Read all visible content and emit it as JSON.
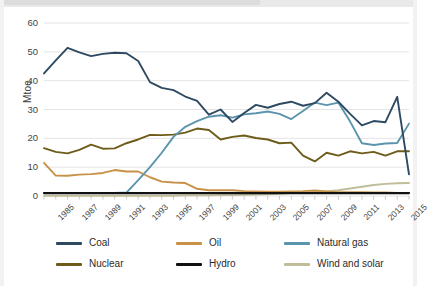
{
  "chart_data": {
    "type": "line",
    "title": "",
    "subtitle": "",
    "xlabel": "",
    "ylabel": "Mtoe",
    "xlim": [
      1985,
      2016
    ],
    "ylim": [
      0,
      60
    ],
    "yticks": [
      0,
      10,
      20,
      30,
      40,
      50,
      60
    ],
    "ytick_labels": [
      "0",
      "10",
      "20",
      "30",
      "40",
      "50",
      "60"
    ],
    "xtick_labels": [
      "1985",
      "1987",
      "1989",
      "1991",
      "1993",
      "1995",
      "1997",
      "1999",
      "2001",
      "2003",
      "2005",
      "2007",
      "2009",
      "2011",
      "2013",
      "2015"
    ],
    "x": [
      1985,
      1986,
      1987,
      1988,
      1989,
      1990,
      1991,
      1992,
      1993,
      1994,
      1995,
      1996,
      1997,
      1998,
      1999,
      2000,
      2001,
      2002,
      2003,
      2004,
      2005,
      2006,
      2007,
      2008,
      2009,
      2010,
      2011,
      2012,
      2013,
      2014,
      2015,
      2016
    ],
    "grid": true,
    "grid_axis": "y",
    "legend_position": "bottom",
    "legend_columns": 3,
    "series": [
      {
        "name": "Coal",
        "color": "#2e4a62",
        "values": [
          42.5,
          47.0,
          51.4,
          49.8,
          48.5,
          49.3,
          49.7,
          49.5,
          46.8,
          39.5,
          37.5,
          36.7,
          34.5,
          33.0,
          28.2,
          30.0,
          25.7,
          28.8,
          31.6,
          30.6,
          31.9,
          32.7,
          31.3,
          32.2,
          35.8,
          32.7,
          28.5,
          24.5,
          26.0,
          25.6,
          34.4,
          7.5
        ]
      },
      {
        "name": "Oil",
        "color": "#c79248",
        "values": [
          11.5,
          7.1,
          7.0,
          7.4,
          7.6,
          8.0,
          9.0,
          8.5,
          8.5,
          6.5,
          5.0,
          4.7,
          4.5,
          2.5,
          2.0,
          2.0,
          2.0,
          1.7,
          1.6,
          1.5,
          1.5,
          1.6,
          1.7,
          1.9,
          1.6,
          1.3,
          1.3,
          1.3,
          1.2,
          1.2,
          1.1,
          1.1
        ]
      },
      {
        "name": "Natural gas",
        "color": "#5b94ad",
        "values": [
          1.0,
          1.1,
          1.1,
          1.1,
          1.1,
          1.1,
          1.1,
          1.2,
          5.5,
          10.0,
          15.0,
          20.5,
          24.0,
          26.0,
          27.5,
          28.0,
          27.2,
          28.3,
          28.7,
          29.3,
          28.5,
          26.7,
          29.5,
          32.4,
          31.5,
          32.4,
          25.8,
          18.3,
          17.7,
          18.2,
          18.4,
          25.1
        ]
      },
      {
        "name": "Nuclear",
        "color": "#6d5c1a",
        "values": [
          16.6,
          15.3,
          14.8,
          16.0,
          17.8,
          16.4,
          16.5,
          18.3,
          19.6,
          21.2,
          21.1,
          21.3,
          22.0,
          23.4,
          22.9,
          19.6,
          20.5,
          21.0,
          20.1,
          19.6,
          18.3,
          18.5,
          14.0,
          12.0,
          15.0,
          14.0,
          15.5,
          14.8,
          15.3,
          14.0,
          15.5,
          15.5
        ]
      },
      {
        "name": "Hydro",
        "color": "#111111",
        "values": [
          1.0,
          1.0,
          1.0,
          1.0,
          1.0,
          1.0,
          1.0,
          1.0,
          1.0,
          1.0,
          1.0,
          1.0,
          1.0,
          1.0,
          1.0,
          1.0,
          1.0,
          1.0,
          1.0,
          1.0,
          1.0,
          1.0,
          1.0,
          1.0,
          1.0,
          1.0,
          1.0,
          1.0,
          1.0,
          1.0,
          1.0,
          1.0
        ]
      },
      {
        "name": "Wind and solar",
        "color": "#bfbd9a",
        "values": [
          0.1,
          0.1,
          0.1,
          0.1,
          0.1,
          0.1,
          0.1,
          0.1,
          0.1,
          0.1,
          0.1,
          0.1,
          0.2,
          0.2,
          0.2,
          0.3,
          0.3,
          0.4,
          0.5,
          0.6,
          0.8,
          1.0,
          1.2,
          1.4,
          1.6,
          2.0,
          2.6,
          3.2,
          3.8,
          4.2,
          4.4,
          4.5
        ]
      }
    ]
  },
  "legend": {
    "items": [
      {
        "label": "Coal",
        "color": "#2e4a62"
      },
      {
        "label": "Oil",
        "color": "#c79248"
      },
      {
        "label": "Natural gas",
        "color": "#5b94ad"
      },
      {
        "label": "Nuclear",
        "color": "#6d5c1a"
      },
      {
        "label": "Hydro",
        "color": "#111111"
      },
      {
        "label": "Wind and solar",
        "color": "#bfbd9a"
      }
    ]
  },
  "axes": {
    "y_axis_title": "Mtoe"
  }
}
